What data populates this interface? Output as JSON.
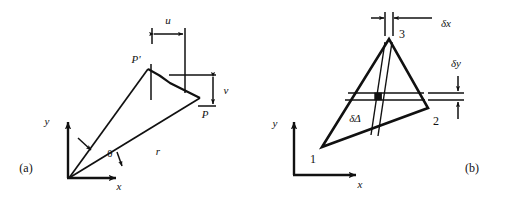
{
  "figure": {
    "background_color": "#ffffff",
    "ink_color": "#111111",
    "width": 508,
    "height": 200
  },
  "panel_a": {
    "caption": "(a)",
    "axes": {
      "x_label": "x",
      "y_label": "y"
    },
    "labels": {
      "point_p_prime": "P'",
      "point_p": "P",
      "displacement_u": "u",
      "displacement_v": "v",
      "radius_r": "r",
      "angle_theta": "θ"
    }
  },
  "panel_b": {
    "caption": "(b)",
    "axes": {
      "x_label": "x",
      "y_label": "y"
    },
    "labels": {
      "vertex_1": "1",
      "vertex_2": "2",
      "vertex_3": "3",
      "delta_x": "δx",
      "delta_y": "δy",
      "delta_area": "δΔ"
    }
  }
}
